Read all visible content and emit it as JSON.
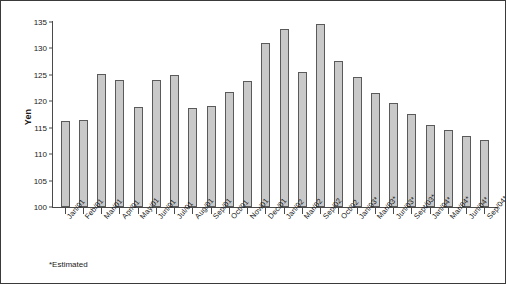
{
  "chart_data": {
    "type": "bar",
    "title": "",
    "subtitle": "",
    "xlabel": "",
    "ylabel": "Yen",
    "ylim": [
      100,
      135
    ],
    "ytick_step": 5,
    "yticks": [
      100,
      105,
      110,
      115,
      120,
      125,
      130,
      135
    ],
    "grid": false,
    "legend": null,
    "bar_color": "#c9c9c9",
    "bar_edge_color": "#5a5a5a",
    "axis_color": "#4a4a4a",
    "text_color": "#1a1a1a",
    "categories": [
      "Jan/01",
      "Feb/01",
      "Mar/01",
      "Apr/01",
      "May/01",
      "Jun/01",
      "Jul/01",
      "Aug/01",
      "Sep/01",
      "Oct/01",
      "Nov/01",
      "Dec/01",
      "Jan/02",
      "Mar/02",
      "Sep/02",
      "Oct/02",
      "Jan/03*",
      "Mar/03*",
      "Jun/03*",
      "Sept/03*",
      "Jan/04*",
      "Mar/04*",
      "Jun/04*",
      "Sep/04*"
    ],
    "values": [
      116.3,
      116.4,
      125.2,
      124.0,
      119.0,
      124.1,
      124.9,
      118.8,
      119.1,
      121.7,
      123.8,
      131.0,
      133.7,
      125.6,
      134.7,
      127.6,
      124.6,
      121.5,
      119.6,
      117.6,
      115.5,
      114.5,
      113.5,
      112.6
    ],
    "annotations": [
      "*Estimated"
    ]
  },
  "footnote": "*Estimated"
}
